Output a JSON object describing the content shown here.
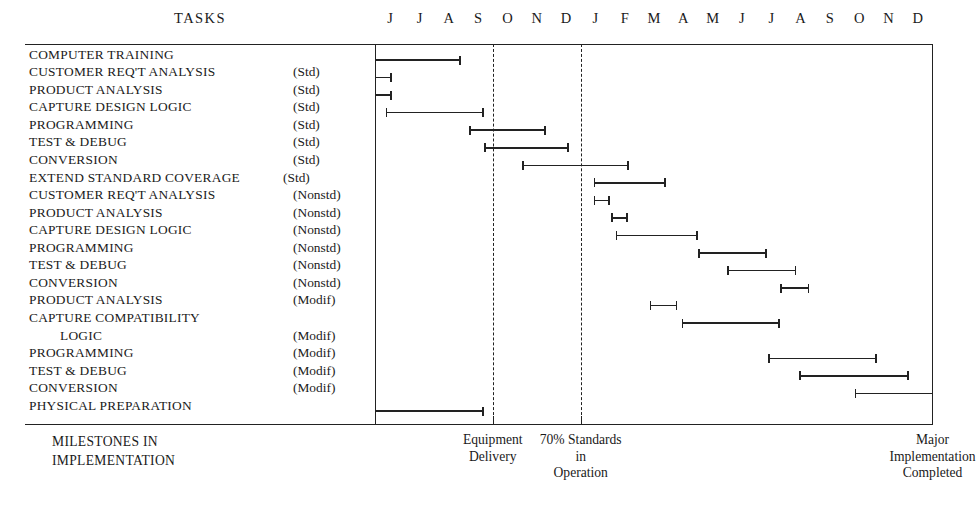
{
  "header": {
    "tasks_column_title": "TASKS",
    "months": [
      "J",
      "J",
      "A",
      "S",
      "O",
      "N",
      "D",
      "J",
      "F",
      "M",
      "A",
      "M",
      "J",
      "J",
      "A",
      "S",
      "O",
      "N",
      "D"
    ]
  },
  "footer": {
    "left_caption_line1": "MILESTONES IN",
    "left_caption_line2": "IMPLEMENTATION",
    "milestones": [
      {
        "label_lines": [
          "Equipment",
          "Delivery"
        ],
        "month_index": 4
      },
      {
        "label_lines": [
          "70% Standards",
          "in",
          "Operation"
        ],
        "month_index": 7
      },
      {
        "label_lines": [
          "Major",
          "Implementation",
          "Completed"
        ],
        "month_index": 19
      }
    ]
  },
  "chart_data": {
    "type": "bar",
    "title": "MILESTONES IN IMPLEMENTATION",
    "xlabel": "",
    "ylabel": "TASKS",
    "grid": false,
    "legend": "none",
    "x_tick_labels": [
      "J",
      "J",
      "A",
      "S",
      "O",
      "N",
      "D",
      "J",
      "F",
      "M",
      "A",
      "M",
      "J",
      "J",
      "A",
      "S",
      "O",
      "N",
      "D"
    ],
    "xlim": [
      0,
      19
    ],
    "markers": [
      {
        "name": "Equipment Delivery",
        "x": 4,
        "style": "dashed"
      },
      {
        "name": "70% Standards in Operation",
        "x": 7,
        "style": "dashed"
      }
    ],
    "categories": [
      "COMPUTER TRAINING",
      "CUSTOMER REQ'T ANALYSIS (Std)",
      "PRODUCT ANALYSIS (Std)",
      "CAPTURE DESIGN LOGIC (Std)",
      "PROGRAMMING (Std)",
      "TEST & DEBUG (Std)",
      "CONVERSION (Std)",
      "EXTEND STANDARD COVERAGE (Std)",
      "CUSTOMER REQ'T ANALYSIS (Nonstd)",
      "PRODUCT ANALYSIS (Nonstd)",
      "CAPTURE DESIGN LOGIC (Nonstd)",
      "PROGRAMMING (Nonstd)",
      "TEST & DEBUG (Nonstd)",
      "CONVERSION (Nonstd)",
      "PRODUCT ANALYSIS (Modif)",
      "CAPTURE COMPATIBILITY LOGIC (Modif)",
      "PROGRAMMING (Modif)",
      "TEST & DEBUG (Modif)",
      "CONVERSION (Modif)",
      "PHYSICAL PREPARATION"
    ],
    "spans": [
      {
        "task": "COMPUTER TRAINING",
        "start": 0.0,
        "end": 2.9
      },
      {
        "task": "CUSTOMER REQ'T ANALYSIS (Std)",
        "start": 0.0,
        "end": 0.55
      },
      {
        "task": "PRODUCT ANALYSIS (Std)",
        "start": 0.0,
        "end": 0.55
      },
      {
        "task": "CAPTURE DESIGN LOGIC (Std)",
        "start": 0.35,
        "end": 3.7
      },
      {
        "task": "PROGRAMMING (Std)",
        "start": 3.2,
        "end": 5.8
      },
      {
        "task": "TEST & DEBUG (Std)",
        "start": 3.7,
        "end": 6.6
      },
      {
        "task": "CONVERSION (Std)",
        "start": 5.0,
        "end": 8.65
      },
      {
        "task": "EXTEND STANDARD COVERAGE (Std)",
        "start": 7.45,
        "end": 9.9
      },
      {
        "task": "CUSTOMER REQ'T ANALYSIS (Nonstd)",
        "start": 7.45,
        "end": 8.0
      },
      {
        "task": "PRODUCT ANALYSIS (Nonstd)",
        "start": 8.05,
        "end": 8.6
      },
      {
        "task": "CAPTURE DESIGN LOGIC (Nonstd)",
        "start": 8.2,
        "end": 11.0
      },
      {
        "task": "PROGRAMMING (Nonstd)",
        "start": 11.0,
        "end": 13.35
      },
      {
        "task": "TEST & DEBUG (Nonstd)",
        "start": 12.0,
        "end": 14.35
      },
      {
        "task": "CONVERSION (Nonstd)",
        "start": 13.8,
        "end": 14.8
      },
      {
        "task": "PRODUCT ANALYSIS (Modif)",
        "start": 9.35,
        "end": 10.3
      },
      {
        "task": "CAPTURE COMPATIBILITY LOGIC (Modif)",
        "start": 10.45,
        "end": 13.8
      },
      {
        "task": "PROGRAMMING (Modif)",
        "start": 13.4,
        "end": 17.1
      },
      {
        "task": "TEST & DEBUG (Modif)",
        "start": 14.45,
        "end": 18.2
      },
      {
        "task": "CONVERSION (Modif)",
        "start": 16.35,
        "end": 19.0
      },
      {
        "task": "PHYSICAL PREPARATION",
        "start": 0.0,
        "end": 3.7
      }
    ]
  },
  "rows": [
    {
      "name": "COMPUTER TRAINING",
      "qual": "",
      "indent": false,
      "bar": {
        "start": 0.0,
        "end": 2.9
      }
    },
    {
      "name": "CUSTOMER REQ'T ANALYSIS",
      "qual": "(Std)",
      "indent": false,
      "bar": {
        "start": 0.0,
        "end": 0.55
      }
    },
    {
      "name": "PRODUCT ANALYSIS",
      "qual": "(Std)",
      "indent": false,
      "bar": {
        "start": 0.0,
        "end": 0.55
      }
    },
    {
      "name": "CAPTURE DESIGN LOGIC",
      "qual": "(Std)",
      "indent": false,
      "bar": {
        "start": 0.35,
        "end": 3.7
      }
    },
    {
      "name": "PROGRAMMING",
      "qual": "(Std)",
      "indent": false,
      "bar": {
        "start": 3.2,
        "end": 5.8
      }
    },
    {
      "name": "TEST & DEBUG",
      "qual": "(Std)",
      "indent": false,
      "bar": {
        "start": 3.7,
        "end": 6.6
      }
    },
    {
      "name": "CONVERSION",
      "qual": "(Std)",
      "indent": false,
      "bar": {
        "start": 5.0,
        "end": 8.65
      }
    },
    {
      "name": "EXTEND STANDARD COVERAGE",
      "qual": "(Std)",
      "indent": false,
      "tight": true,
      "bar": {
        "start": 7.45,
        "end": 9.9
      }
    },
    {
      "name": "CUSTOMER REQ'T ANALYSIS",
      "qual": "(Nonstd)",
      "indent": false,
      "bar": {
        "start": 7.45,
        "end": 8.0
      }
    },
    {
      "name": "PRODUCT ANALYSIS",
      "qual": "(Nonstd)",
      "indent": false,
      "bar": {
        "start": 8.05,
        "end": 8.6
      }
    },
    {
      "name": "CAPTURE DESIGN LOGIC",
      "qual": "(Nonstd)",
      "indent": false,
      "bar": {
        "start": 8.2,
        "end": 11.0
      }
    },
    {
      "name": "PROGRAMMING",
      "qual": "(Nonstd)",
      "indent": false,
      "bar": {
        "start": 11.0,
        "end": 13.35
      }
    },
    {
      "name": "TEST & DEBUG",
      "qual": "(Nonstd)",
      "indent": false,
      "bar": {
        "start": 12.0,
        "end": 14.35
      }
    },
    {
      "name": "CONVERSION",
      "qual": "(Nonstd)",
      "indent": false,
      "bar": {
        "start": 13.8,
        "end": 14.8
      }
    },
    {
      "name": "PRODUCT ANALYSIS",
      "qual": "(Modif)",
      "indent": false,
      "bar": {
        "start": 9.35,
        "end": 10.3
      }
    },
    {
      "name": "CAPTURE COMPATIBILITY",
      "qual": "",
      "indent": false,
      "bar": {
        "start": 10.45,
        "end": 13.8
      }
    },
    {
      "name": "LOGIC",
      "qual": "(Modif)",
      "indent": true,
      "bar": null
    },
    {
      "name": "PROGRAMMING",
      "qual": "(Modif)",
      "indent": false,
      "bar": {
        "start": 13.4,
        "end": 17.1
      }
    },
    {
      "name": "TEST & DEBUG",
      "qual": "(Modif)",
      "indent": false,
      "bar": {
        "start": 14.45,
        "end": 18.2
      }
    },
    {
      "name": "CONVERSION",
      "qual": "(Modif)",
      "indent": false,
      "bar": {
        "start": 16.35,
        "end": 19.0
      }
    },
    {
      "name": "PHYSICAL PREPARATION",
      "qual": "",
      "indent": false,
      "bar": {
        "start": 0.0,
        "end": 3.7
      }
    }
  ]
}
